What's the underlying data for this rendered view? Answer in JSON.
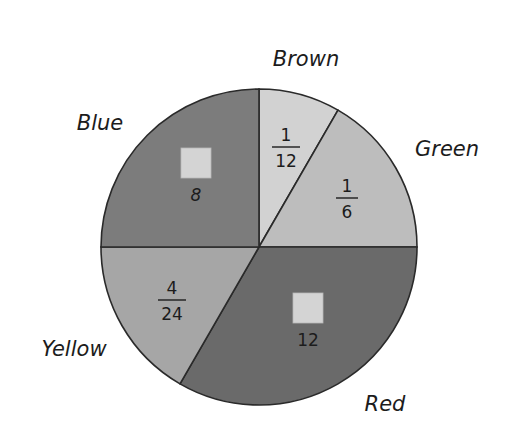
{
  "chart_data": {
    "type": "pie",
    "title": "",
    "center": [
      259,
      247
    ],
    "radius": 158,
    "start_angle_deg_clockwise_from_top": 0,
    "slices": [
      {
        "name": "Brown",
        "label": "Brown",
        "fraction_text": {
          "numerator": "1",
          "denominator": "12"
        },
        "numerator_blank": false,
        "angle_deg": 30,
        "share": 0.0833,
        "fill": "#d2d2d2",
        "label_pos": [
          306,
          66
        ],
        "frac_pos": [
          286,
          147
        ]
      },
      {
        "name": "Green",
        "label": "Green",
        "fraction_text": {
          "numerator": "1",
          "denominator": "6"
        },
        "numerator_blank": false,
        "angle_deg": 60,
        "share": 0.1667,
        "fill": "#bdbdbd",
        "label_pos": [
          447,
          156
        ],
        "frac_pos": [
          347,
          198
        ]
      },
      {
        "name": "Red",
        "label": "Red",
        "fraction_text": {
          "numerator": "",
          "denominator": "12"
        },
        "numerator_blank": true,
        "angle_deg": 120,
        "share": 0.3333,
        "fill": "#6a6a6a",
        "label_pos": [
          385,
          411
        ],
        "frac_pos": [
          308,
          310
        ]
      },
      {
        "name": "Yellow",
        "label": "Yellow",
        "fraction_text": {
          "numerator": "4",
          "denominator": "24"
        },
        "numerator_blank": false,
        "angle_deg": 60,
        "share": 0.1667,
        "fill": "#a6a6a6",
        "label_pos": [
          74,
          356
        ],
        "frac_pos": [
          172,
          300
        ]
      },
      {
        "name": "Blue",
        "label": "Blue",
        "fraction_text": {
          "numerator": "",
          "denominator": "8"
        },
        "numerator_blank": true,
        "angle_deg": 90,
        "share": 0.25,
        "fill": "#7c7c7c",
        "label_pos": [
          100,
          130
        ],
        "frac_pos": [
          196,
          165
        ]
      }
    ],
    "legend": "none (labels placed outside slices)",
    "annotations": [
      "Blue slice shows a blank box over denominator 8",
      "Red slice shows a blank box over denominator 12"
    ]
  },
  "styles": {
    "outline_color": "#2a2a2a",
    "answer_box_fill": "#d4d4d4",
    "background": "#ffffff"
  }
}
